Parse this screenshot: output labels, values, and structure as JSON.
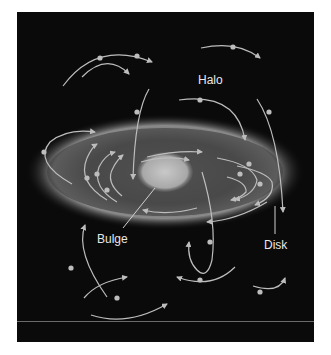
{
  "diagram": {
    "labels": {
      "halo": "Halo",
      "bulge": "Bulge",
      "disk": "Disk"
    },
    "colors": {
      "background": "#0a0a0a",
      "orbit_line": "#bdbdbd",
      "disk_glow": "#8a8a8a",
      "bulge": "#b8b8b8",
      "text": "#e8e8e8",
      "divider": "#6a6a6a"
    },
    "components": [
      {
        "name": "halo",
        "description": "Random elliptical orbits of stars around the galaxy"
      },
      {
        "name": "disk",
        "description": "Flat rotating disk with stars on circular orbits"
      },
      {
        "name": "bulge",
        "description": "Central bright spheroid"
      }
    ]
  }
}
